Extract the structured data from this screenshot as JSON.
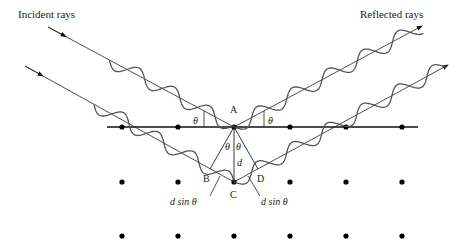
{
  "labels": {
    "incident": "Incident rays",
    "reflected": "Reflected rays",
    "A": "A",
    "B": "B",
    "C": "C",
    "D": "D",
    "d": "d",
    "theta": "θ",
    "dsin_left": "d sin θ",
    "dsin_right": "d sin θ"
  },
  "lattice": {
    "columns_x": [
      122,
      178,
      234,
      290,
      346,
      402
    ],
    "rows_y": [
      127,
      182,
      236
    ]
  },
  "colors": {
    "line": "#111111",
    "wave": "#555555",
    "dot": "#000000"
  }
}
